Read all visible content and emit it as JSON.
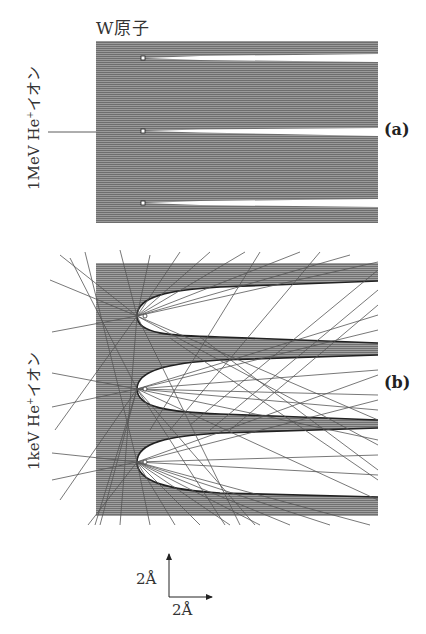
{
  "figure": {
    "title": "W原子",
    "panels": [
      {
        "id": "a",
        "label": "(a)",
        "ion_label_main": "1MeV He",
        "ion_label_sup": "+",
        "ion_label_suffix": "イオン",
        "description": "High-energy ions: straight parallel trajectories, narrow shadow cones behind W atoms"
      },
      {
        "id": "b",
        "label": "(b)",
        "ion_label_main": "1keV He",
        "ion_label_sup": "+",
        "ion_label_suffix": "イオン",
        "description": "Low-energy ions: trajectories deflected, wide parabolic shadow cones behind W atoms"
      }
    ],
    "scale_bar": {
      "vertical_label": "2Å",
      "horizontal_label": "2Å"
    },
    "colors": {
      "trajectory": "#555555",
      "background": "#ffffff",
      "panel_fill": "#8a8a8a"
    }
  }
}
